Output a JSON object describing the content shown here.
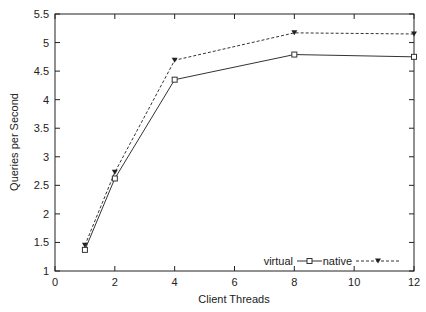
{
  "chart_data": {
    "type": "line",
    "title": "",
    "xlabel": "Client Threads",
    "ylabel": "Queries per Second",
    "xlim": [
      0,
      12
    ],
    "ylim": [
      1,
      5.5
    ],
    "xticks": [
      0,
      2,
      4,
      6,
      8,
      10,
      12
    ],
    "yticks": [
      1,
      1.5,
      2,
      2.5,
      3,
      3.5,
      4,
      4.5,
      5,
      5.5
    ],
    "grid": false,
    "legend_position": "bottom-right inside",
    "x": [
      1,
      2,
      4,
      8,
      12
    ],
    "series": [
      {
        "name": "virtual",
        "style": "solid",
        "marker": "open-square",
        "values": [
          1.37,
          2.62,
          4.35,
          4.79,
          4.75
        ]
      },
      {
        "name": "native",
        "style": "dashed",
        "marker": "filled-triangle-down",
        "values": [
          1.45,
          2.73,
          4.69,
          5.17,
          5.15
        ]
      }
    ]
  }
}
